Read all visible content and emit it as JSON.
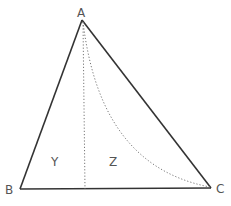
{
  "diagram": {
    "type": "triangle",
    "vertices": {
      "A": {
        "label": "A"
      },
      "B": {
        "label": "B"
      },
      "C": {
        "label": "C"
      }
    },
    "regions": [
      {
        "label": "Y"
      },
      {
        "label": "Z"
      }
    ],
    "edges": [
      {
        "from": "A",
        "to": "B",
        "style": "solid"
      },
      {
        "from": "B",
        "to": "C",
        "style": "solid"
      },
      {
        "from": "C",
        "to": "A",
        "style": "solid"
      }
    ],
    "auxiliary_lines": [
      {
        "description": "vertical altitude from A to BC",
        "style": "dotted"
      },
      {
        "description": "curved arc from A to C",
        "style": "dotted"
      }
    ],
    "colors": {
      "line": "#333333",
      "dotted": "#777777",
      "label": "#555555"
    }
  }
}
